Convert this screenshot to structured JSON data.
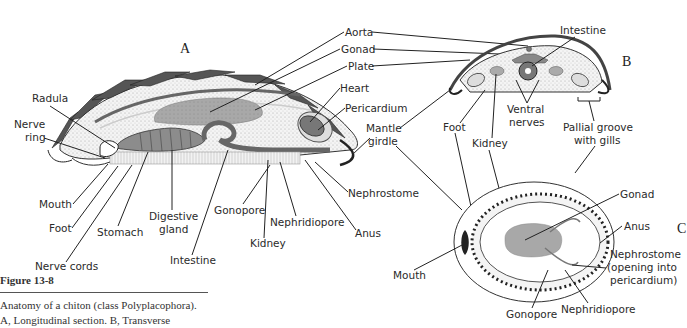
{
  "figure": {
    "title": "Figure 13-8",
    "caption_line1": "Anatomy of a chiton (class Polyplacophora).",
    "caption_line2": "A, Longitudinal section. B, Transverse"
  },
  "panels": {
    "a": "A",
    "b": "B",
    "c": "C"
  },
  "labels_a": {
    "radula": "Radula",
    "nerve_ring_1": "Nerve",
    "nerve_ring_2": "ring",
    "mouth": "Mouth",
    "foot": "Foot",
    "stomach": "Stomach",
    "nerve_cords": "Nerve cords",
    "digestive_gland_1": "Digestive",
    "digestive_gland_2": "gland",
    "intestine": "Intestine",
    "gonopore": "Gonopore",
    "kidney": "Kidney",
    "nephridiopore": "Nephridiopore",
    "anus": "Anus",
    "nephrostome": "Nephrostome",
    "heart": "Heart",
    "pericardium": "Pericardium",
    "mantle_girdle_1": "Mantle",
    "mantle_girdle_2": "girdle"
  },
  "labels_shared": {
    "aorta": "Aorta",
    "gonad": "Gonad",
    "plate": "Plate"
  },
  "labels_b": {
    "intestine": "Intestine",
    "foot": "Foot",
    "kidney": "Kidney",
    "ventral_nerves_1": "Ventral",
    "ventral_nerves_2": "nerves",
    "pallial_groove_1": "Pallial groove",
    "pallial_groove_2": "with gills"
  },
  "labels_c": {
    "mouth": "Mouth",
    "gonad": "Gonad",
    "anus": "Anus",
    "nephrostome_1": "Nephrostome",
    "nephrostome_2": "(opening into",
    "nephrostome_3": "pericardium)",
    "gonopore": "Gonopore",
    "nephridiopore": "Nephridiopore"
  }
}
